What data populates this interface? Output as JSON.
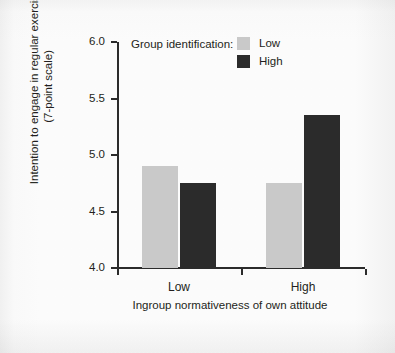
{
  "chart_data": {
    "type": "bar",
    "title": "",
    "xlabel": "Ingroup normativeness of own attitude",
    "ylabel": "Intention to engage in regular exercise (7-point scale)",
    "ylabel_line1": "Intention to engage in regular exercise",
    "ylabel_line2": "(7-point scale)",
    "categories": [
      "Low",
      "High"
    ],
    "ylim": [
      4.0,
      6.0
    ],
    "ytick_labels": [
      "4.0",
      "4.5",
      "5.0",
      "5.5",
      "6.0"
    ],
    "ytick_values": [
      4.0,
      4.5,
      5.0,
      5.5,
      6.0
    ],
    "grid": false,
    "legend_position": "top-right",
    "legend_title": "Group identification:",
    "series": [
      {
        "name": "Low",
        "values": [
          4.9,
          4.75
        ],
        "color": "#c9c9c9"
      },
      {
        "name": "High",
        "values": [
          4.75,
          5.35
        ],
        "color": "#2b2b2b"
      }
    ]
  },
  "legend": {
    "title": "Group identification:",
    "entries": [
      {
        "label": "Low",
        "swatch": "low-swatch"
      },
      {
        "label": "High",
        "swatch": "high-swatch"
      }
    ]
  },
  "axes": {
    "y_title_line1": "Intention to engage in regular exercise",
    "y_title_line2": "(7-point scale)",
    "x_title": "Ingroup normativeness of own attitude",
    "y_ticks": [
      "6.0",
      "5.5",
      "5.0",
      "4.5",
      "4.0"
    ],
    "x_ticks": [
      "Low",
      "High"
    ]
  },
  "colors": {
    "low_bar": "#c9c9c9",
    "high_bar": "#2b2b2b",
    "axis": "#2b2b2b",
    "text": "#231f20",
    "background": "#fcfcfc"
  }
}
